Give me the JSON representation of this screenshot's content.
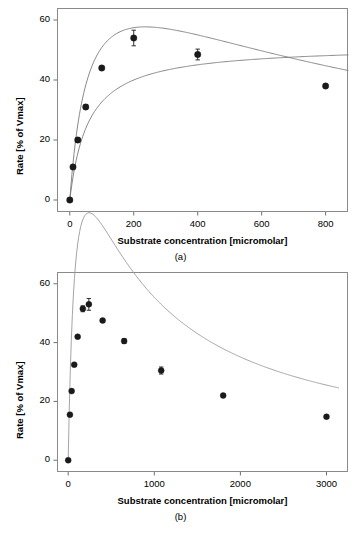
{
  "figure": {
    "panels": [
      {
        "caption": "(a)",
        "xlabel": "Substrate concentration [micromolar]",
        "ylabel": "Rate [% of Vmax]"
      },
      {
        "caption": "(b)",
        "xlabel": "Substrate concentration [micromolar]",
        "ylabel": "Rate [% of Vmax]"
      }
    ]
  },
  "chart_data": [
    {
      "type": "scatter",
      "title": "",
      "panel": "(a)",
      "xlabel": "Substrate concentration [micromolar]",
      "ylabel": "Rate [% of Vmax]",
      "xlim": [
        -40,
        870
      ],
      "ylim": [
        -4,
        64
      ],
      "xticks": [
        0,
        200,
        400,
        600,
        800
      ],
      "yticks": [
        0,
        20,
        40,
        60
      ],
      "xtick_labels": [
        "0",
        "200",
        "400",
        "600",
        "800"
      ],
      "ytick_labels": [
        "0",
        "20",
        "40",
        "60"
      ],
      "grid": false,
      "legend": "none",
      "marker_color": "#1a1a1a",
      "line_color": "#7a7a7a",
      "points": [
        {
          "x": 0,
          "y": 0,
          "yerr": 0
        },
        {
          "x": 10,
          "y": 11,
          "yerr": 0
        },
        {
          "x": 25,
          "y": 20,
          "yerr": 0.8
        },
        {
          "x": 50,
          "y": 31,
          "yerr": 0.7
        },
        {
          "x": 100,
          "y": 44,
          "yerr": 0
        },
        {
          "x": 200,
          "y": 54,
          "yerr": 2.6
        },
        {
          "x": 400,
          "y": 48.5,
          "yerr": 1.8
        },
        {
          "x": 800,
          "y": 38,
          "yerr": 0
        }
      ],
      "series": [
        {
          "name": "substrate inhibition fit",
          "description": "rises steeply, peaks near 53.5 at about 230 micromolar, then declines to about 38 at 800 micromolar"
        },
        {
          "name": "Michaelis-Menten fit",
          "description": "hyperbolic saturation curve approaching about 49 percent of Vmax"
        }
      ],
      "curve_crossing_x": 450
    },
    {
      "type": "scatter",
      "title": "",
      "panel": "(b)",
      "xlabel": "Substrate concentration [micromolar]",
      "ylabel": "Rate [% of Vmax]",
      "xlim": [
        -130,
        3250
      ],
      "ylim": [
        -4,
        64
      ],
      "xticks": [
        0,
        1000,
        2000,
        3000
      ],
      "yticks": [
        0,
        20,
        40,
        60
      ],
      "xtick_labels": [
        "0",
        "1000",
        "2000",
        "3000"
      ],
      "ytick_labels": [
        "0",
        "20",
        "40",
        "60"
      ],
      "grid": false,
      "legend": "none",
      "marker_color": "#1a1a1a",
      "line_color": "#9a9a9a",
      "points": [
        {
          "x": 0,
          "y": 0,
          "yerr": 0
        },
        {
          "x": 20,
          "y": 15.5,
          "yerr": 0
        },
        {
          "x": 40,
          "y": 23.5,
          "yerr": 0
        },
        {
          "x": 70,
          "y": 32.5,
          "yerr": 0
        },
        {
          "x": 110,
          "y": 42,
          "yerr": 0
        },
        {
          "x": 170,
          "y": 51.5,
          "yerr": 1.0
        },
        {
          "x": 240,
          "y": 53,
          "yerr": 2.0
        },
        {
          "x": 400,
          "y": 47.5,
          "yerr": 0
        },
        {
          "x": 650,
          "y": 40.5,
          "yerr": 0.8
        },
        {
          "x": 1080,
          "y": 30.5,
          "yerr": 1.2
        },
        {
          "x": 1800,
          "y": 22,
          "yerr": 0
        },
        {
          "x": 3000,
          "y": 14.8,
          "yerr": 0
        }
      ],
      "series": [
        {
          "name": "substrate inhibition fit",
          "description": "steep rise to a peak near 53 at about 240 micromolar, followed by a long hyperbolic decline to about 15 at 3000 micromolar"
        }
      ]
    }
  ]
}
